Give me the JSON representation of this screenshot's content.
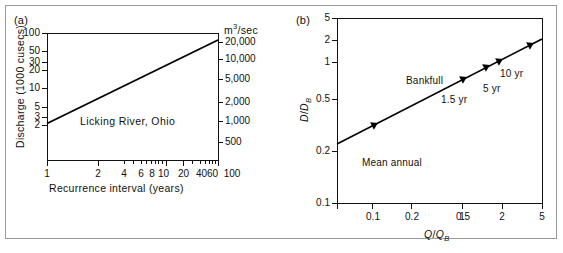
{
  "figure": {
    "background": "#ffffff",
    "border_color": "#9a9a9a",
    "line_color": "#000000"
  },
  "panel_a": {
    "tag": "(a)",
    "note": "Licking River, Ohio",
    "y_title": "Discharge (1000 cusecs)",
    "x_title": "Recurrence interval (years)",
    "y2_title_base": "m",
    "y2_title_sup": "3",
    "y2_title_rest": "/sec",
    "y_ticks": [
      "100",
      "50",
      "30",
      "20",
      "10",
      "5",
      "3",
      "2"
    ],
    "y2_ticks": [
      "20,000",
      "10,000",
      "5,000",
      "2,000",
      "1,000",
      "500"
    ],
    "x_ticks": [
      "1",
      "2",
      "4",
      "6",
      "8",
      "10",
      "20",
      "40",
      "60",
      "100"
    ]
  },
  "panel_b": {
    "tag": "(b)",
    "y_title_num": "D",
    "y_title_den": "D",
    "y_title_den_sub": "B",
    "x_title_num": "Q",
    "x_title_den": "Q",
    "x_title_den_sub": "B",
    "y_ticks": [
      "5",
      "2",
      "1",
      "0.5",
      "0.2",
      "0.1"
    ],
    "x_ticks": [
      "0.1",
      "0.2",
      "0.5",
      "1",
      "2",
      "5"
    ],
    "annotations": [
      "Mean annual",
      "Bankfull",
      "1.5 yr",
      "5 yr",
      "10 yr"
    ]
  },
  "chart_data": [
    {
      "type": "line",
      "panel": "(a)",
      "title": "Licking River, Ohio",
      "xlabel": "Recurrence interval (years)",
      "ylabel": "Discharge (1000 cusecs)",
      "y2label": "m3/sec",
      "xscale": "log",
      "yscale": "log",
      "xlim": [
        1,
        100
      ],
      "ylim": [
        1.8,
        100
      ],
      "xticks": [
        1,
        2,
        4,
        6,
        8,
        10,
        20,
        40,
        60,
        100
      ],
      "xticklabels": [
        "1",
        "2",
        "4",
        "6",
        "8",
        "10",
        "20",
        "40",
        "60",
        "100"
      ],
      "yticks": [
        2,
        3,
        5,
        10,
        20,
        30,
        50,
        100
      ],
      "yticklabels": [
        "2",
        "3",
        "5",
        "10",
        "20",
        "30",
        "50",
        "100"
      ],
      "y2ticks": [
        500,
        1000,
        2000,
        5000,
        10000,
        20000
      ],
      "y2ticklabels": [
        "500",
        "1,000",
        "2,000",
        "5,000",
        "10,000",
        "20,000"
      ],
      "grid": false,
      "legend": "none",
      "series": [
        {
          "name": "Licking River, Ohio",
          "x": [
            1,
            100
          ],
          "y": [
            3.8,
            70
          ]
        }
      ]
    },
    {
      "type": "line",
      "panel": "(b)",
      "title": "",
      "xlabel": "Q/Q_B",
      "ylabel": "D/D_B",
      "xscale": "log",
      "yscale": "log",
      "xlim": [
        0.055,
        5
      ],
      "ylim": [
        0.1,
        5
      ],
      "xticks": [
        0.1,
        0.2,
        0.5,
        1,
        2,
        5
      ],
      "xticklabels": [
        "0.1",
        "0.2",
        "0.5",
        "1",
        "2",
        "5"
      ],
      "yticks": [
        0.1,
        0.2,
        0.5,
        1,
        2,
        5
      ],
      "yticklabels": [
        "0.1",
        "0.2",
        "0.5",
        "1",
        "2",
        "5"
      ],
      "grid": false,
      "legend": "none",
      "series": [
        {
          "name": "hydraulic geometry",
          "x": [
            0.055,
            5
          ],
          "y": [
            0.23,
            2.05
          ]
        }
      ],
      "points": [
        {
          "label": "Mean annual",
          "x": 0.115,
          "y": 0.3
        },
        {
          "label": "1.5 yr",
          "x": 0.95,
          "y": 0.95
        },
        {
          "label": "Bankfull",
          "x": 0.95,
          "y": 0.95
        },
        {
          "label": "5 yr",
          "x": 1.62,
          "y": 1.22
        },
        {
          "label": "10 yr",
          "x": 2.1,
          "y": 1.37
        },
        {
          "label": "",
          "x": 4.2,
          "y": 1.88
        }
      ]
    }
  ]
}
